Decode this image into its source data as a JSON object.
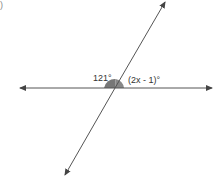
{
  "diagram": {
    "type": "intersecting-lines",
    "corner_mark": ")",
    "angle_left_label": "121°",
    "angle_right_label": "(2x - 1)°",
    "colors": {
      "line": "#555555",
      "shaded_angle": "#777777",
      "background": "#ffffff"
    }
  }
}
